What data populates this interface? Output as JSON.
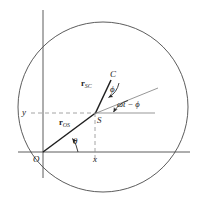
{
  "figure": {
    "type": "geometry-diagram",
    "colors": {
      "stroke": "#3a3a3a",
      "dashed": "#8a8a8a",
      "text": "#1a1a1a",
      "background": "#ffffff"
    },
    "geometry": {
      "circle": {
        "cx": 103,
        "cy": 107,
        "r": 85
      },
      "origin": {
        "x": 43,
        "y": 152
      },
      "point_S": {
        "x": 95,
        "y": 113
      },
      "point_C": {
        "x": 112,
        "y": 79
      },
      "x_axis": {
        "x1": 18,
        "y1": 152,
        "x2": 190,
        "y2": 152
      },
      "y_axis": {
        "x1": 43,
        "y1": 10,
        "x2": 43,
        "y2": 178
      },
      "ray_through_S": {
        "x1": 95,
        "y1": 113,
        "x2": 160,
        "y2": 88
      },
      "horizontal_through_S": {
        "x1": 95,
        "y1": 113,
        "x2": 155,
        "y2": 113
      }
    },
    "labels": {
      "origin": "O",
      "point_s": "S",
      "point_c": "C",
      "x_axis": "x",
      "y_axis": "y",
      "vector_os_bold": "r",
      "vector_os_sub": "OS",
      "vector_sc_bold": "r",
      "vector_sc_sub": "SC",
      "angle_theta": "θ",
      "angle_phi": "ϕ",
      "angle_omega_t_minus_phi": "ωt − ϕ"
    }
  }
}
